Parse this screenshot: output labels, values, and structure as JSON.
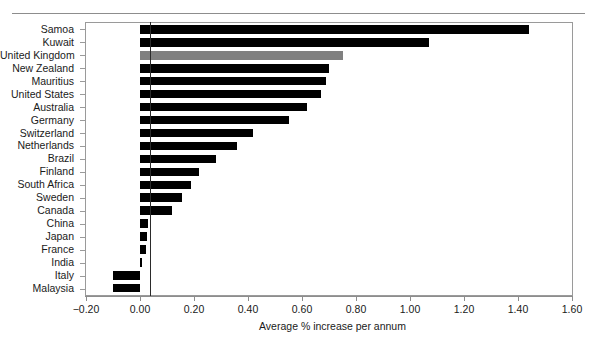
{
  "chart_data": {
    "type": "bar",
    "orientation": "horizontal",
    "title": "",
    "subtitle": "",
    "xlabel": "Average % increase per annum",
    "ylabel": "",
    "xlim": [
      -0.2,
      1.6
    ],
    "ylim": null,
    "grid": false,
    "legend": null,
    "xticks": [
      "-0.20",
      "0.00",
      "0.20",
      "0.40",
      "0.60",
      "0.80",
      "1.00",
      "1.20",
      "1.40",
      "1.60"
    ],
    "xtick_values": [
      -0.2,
      0.0,
      0.2,
      0.4,
      0.6,
      0.8,
      1.0,
      1.2,
      1.4,
      1.6
    ],
    "categories": [
      "Samoa",
      "Kuwait",
      "United Kingdom",
      "New Zealand",
      "Mauritius",
      "United States",
      "Australia",
      "Germany",
      "Switzerland",
      "Netherlands",
      "Brazil",
      "Finland",
      "South Africa",
      "Sweden",
      "Canada",
      "China",
      "Japan",
      "France",
      "India",
      "Italy",
      "Malaysia"
    ],
    "values": [
      1.44,
      1.07,
      0.75,
      0.7,
      0.69,
      0.67,
      0.62,
      0.55,
      0.42,
      0.36,
      0.28,
      0.22,
      0.19,
      0.155,
      0.12,
      0.03,
      0.027,
      0.023,
      0.007,
      -0.1,
      -0.1
    ],
    "bar_colors": [
      "#000000",
      "#000000",
      "#808080",
      "#000000",
      "#000000",
      "#000000",
      "#000000",
      "#000000",
      "#000000",
      "#000000",
      "#000000",
      "#000000",
      "#000000",
      "#000000",
      "#000000",
      "#000000",
      "#000000",
      "#000000",
      "#000000",
      "#000000",
      "#000000"
    ],
    "highlight_category": "United Kingdom",
    "colors": {
      "bar_default": "#000000",
      "bar_highlight": "#808080",
      "axis": "#8d8d8d",
      "zero_line": "#2b2b2b",
      "text": "#1a1a1a",
      "background": "#ffffff"
    }
  }
}
